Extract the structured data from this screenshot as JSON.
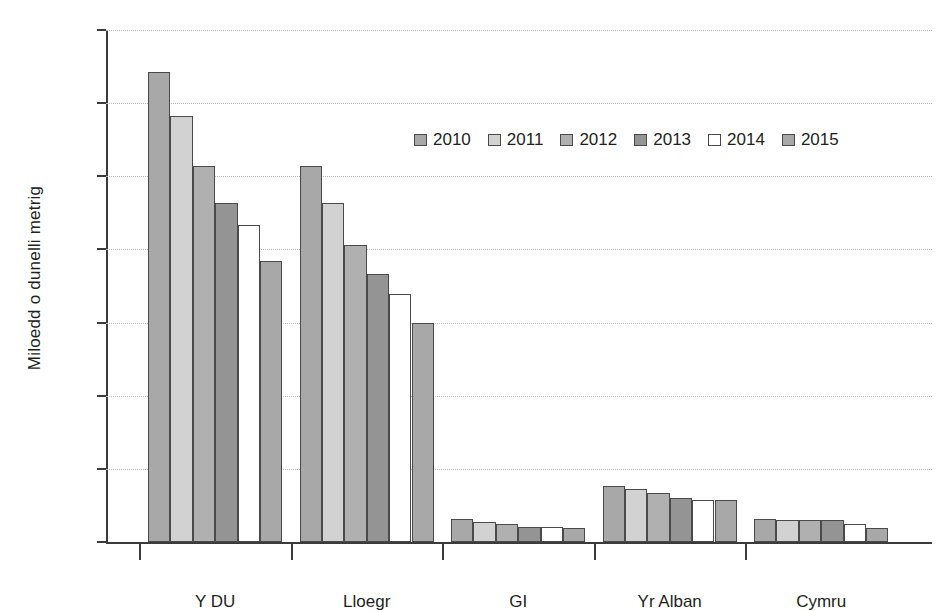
{
  "chart_data": {
    "type": "bar",
    "title": "",
    "subtitle": "",
    "xlabel": "",
    "ylabel": "Miloedd o dunelli metrig",
    "categories": [
      "Y DU",
      "Lloegr",
      "GI",
      "Yr Alban",
      "Cymru"
    ],
    "series": [
      {
        "name": "2010",
        "color": "#a8a8a8",
        "values": [
          12850,
          10280,
          630,
          1520,
          640
        ]
      },
      {
        "name": "2011",
        "color": "#d2d2d2",
        "values": [
          11650,
          9280,
          560,
          1450,
          610
        ]
      },
      {
        "name": "2012",
        "color": "#b0b0b0",
        "values": [
          10280,
          8130,
          490,
          1330,
          600
        ]
      },
      {
        "name": "2013",
        "color": "#949494",
        "values": [
          9280,
          7320,
          400,
          1210,
          600
        ]
      },
      {
        "name": "2014",
        "color": "#ffffff",
        "values": [
          8670,
          6790,
          410,
          1150,
          490
        ]
      },
      {
        "name": "2015",
        "color": "#a8a8a8",
        "values": [
          7680,
          6000,
          370,
          1140,
          370
        ]
      }
    ],
    "ylim": [
      0,
      14000
    ],
    "ytick_labels": [
      "14000",
      "12000",
      "10000",
      "8000",
      "6000",
      "4000",
      "2000",
      "0"
    ],
    "ytick_values": [
      14000,
      12000,
      10000,
      8000,
      6000,
      4000,
      2000,
      0
    ],
    "grid": true,
    "grid_style": "dotted",
    "grid_color": "#b9b9b9",
    "legend_position": "upper-center",
    "axis_color": "#3b3b3b",
    "text_color": "#231f20",
    "background": "#ffffff"
  },
  "legend": {
    "items": [
      {
        "label": "2010"
      },
      {
        "label": "2011"
      },
      {
        "label": "2012"
      },
      {
        "label": "2013"
      },
      {
        "label": "2014"
      },
      {
        "label": "2015"
      }
    ]
  }
}
